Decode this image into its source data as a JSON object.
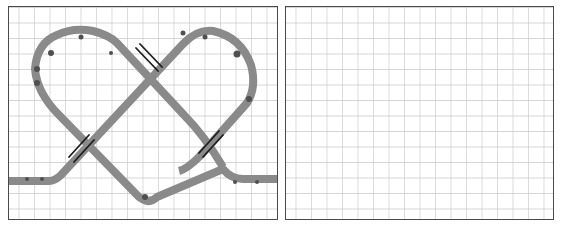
{
  "figure": {
    "panel_count": 2,
    "grid": {
      "spacing_px": 15.5,
      "line_color": "#c8c8c8",
      "border_color": "#4a4a4a"
    },
    "colors": {
      "track": "#8a8a8a",
      "track_dots": "#505050",
      "crossing_marker": "#1e1e1e"
    }
  },
  "panels": [
    {
      "id": "left",
      "label": "track-panel",
      "content": "knot-track",
      "crossings": 3,
      "description": "Gray track forming a two-lobed loop with three crossings marked by dark bars"
    },
    {
      "id": "right",
      "label": "empty-panel",
      "content": "empty-grid"
    }
  ]
}
